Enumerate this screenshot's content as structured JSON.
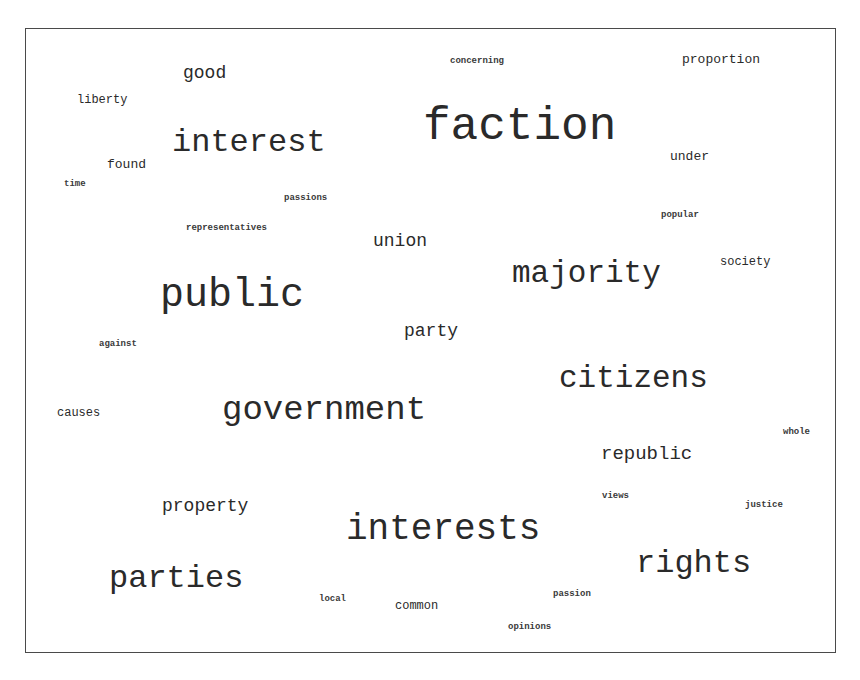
{
  "word_cloud": {
    "border_color": "#4a4a4a",
    "text_color": "#2a2a2a",
    "words": [
      {
        "text": "faction",
        "x": 423,
        "y": 104,
        "size": 46,
        "bold": false
      },
      {
        "text": "interest",
        "x": 172,
        "y": 127,
        "size": 32,
        "bold": false
      },
      {
        "text": "public",
        "x": 160,
        "y": 276,
        "size": 40,
        "bold": false
      },
      {
        "text": "majority",
        "x": 512,
        "y": 258,
        "size": 31,
        "bold": false
      },
      {
        "text": "government",
        "x": 222,
        "y": 393,
        "size": 34,
        "bold": false
      },
      {
        "text": "citizens",
        "x": 559,
        "y": 363,
        "size": 31,
        "bold": false
      },
      {
        "text": "interests",
        "x": 346,
        "y": 512,
        "size": 36,
        "bold": false
      },
      {
        "text": "rights",
        "x": 636,
        "y": 548,
        "size": 32,
        "bold": false
      },
      {
        "text": "parties",
        "x": 109,
        "y": 563,
        "size": 32,
        "bold": false
      },
      {
        "text": "republic",
        "x": 601,
        "y": 445,
        "size": 19,
        "bold": false
      },
      {
        "text": "property",
        "x": 162,
        "y": 497,
        "size": 18,
        "bold": false
      },
      {
        "text": "union",
        "x": 373,
        "y": 232,
        "size": 18,
        "bold": false
      },
      {
        "text": "party",
        "x": 404,
        "y": 322,
        "size": 18,
        "bold": false
      },
      {
        "text": "good",
        "x": 183,
        "y": 64,
        "size": 18,
        "bold": false
      },
      {
        "text": "proportion",
        "x": 682,
        "y": 53,
        "size": 13,
        "bold": false
      },
      {
        "text": "under",
        "x": 670,
        "y": 150,
        "size": 13,
        "bold": false
      },
      {
        "text": "society",
        "x": 720,
        "y": 256,
        "size": 12,
        "bold": false
      },
      {
        "text": "found",
        "x": 107,
        "y": 158,
        "size": 13,
        "bold": false
      },
      {
        "text": "liberty",
        "x": 77,
        "y": 94,
        "size": 12,
        "bold": false
      },
      {
        "text": "causes",
        "x": 57,
        "y": 407,
        "size": 12,
        "bold": false
      },
      {
        "text": "common",
        "x": 395,
        "y": 600,
        "size": 12,
        "bold": false
      },
      {
        "text": "concerning",
        "x": 450,
        "y": 57,
        "size": 9,
        "bold": true
      },
      {
        "text": "time",
        "x": 64,
        "y": 180,
        "size": 9,
        "bold": true
      },
      {
        "text": "passions",
        "x": 284,
        "y": 194,
        "size": 9,
        "bold": true
      },
      {
        "text": "representatives",
        "x": 186,
        "y": 224,
        "size": 9,
        "bold": true
      },
      {
        "text": "popular",
        "x": 661,
        "y": 211,
        "size": 9,
        "bold": true
      },
      {
        "text": "against",
        "x": 99,
        "y": 340,
        "size": 9,
        "bold": true
      },
      {
        "text": "whole",
        "x": 783,
        "y": 428,
        "size": 9,
        "bold": true
      },
      {
        "text": "views",
        "x": 602,
        "y": 492,
        "size": 9,
        "bold": true
      },
      {
        "text": "justice",
        "x": 745,
        "y": 501,
        "size": 9,
        "bold": true
      },
      {
        "text": "local",
        "x": 319,
        "y": 595,
        "size": 9,
        "bold": true
      },
      {
        "text": "passion",
        "x": 553,
        "y": 590,
        "size": 9,
        "bold": true
      },
      {
        "text": "opinions",
        "x": 508,
        "y": 623,
        "size": 9,
        "bold": true
      }
    ]
  }
}
